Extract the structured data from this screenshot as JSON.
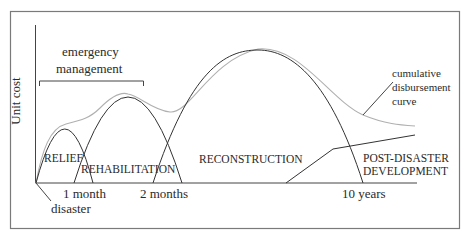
{
  "diagram": {
    "y_axis_label": "Unit cost",
    "bracket_label_line1": "emergency",
    "bracket_label_line2": "management",
    "phases": {
      "relief": "RELIEF",
      "rehabilitation": "REHABILITATION",
      "reconstruction": "RECONSTRUCTION",
      "development_line1": "POST-DISASTER",
      "development_line2": "DEVELOPMENT"
    },
    "x_ticks": {
      "disaster": "disaster",
      "one_month": "1 month",
      "two_months": "2 months",
      "ten_years": "10 years"
    },
    "annotation": {
      "line1": "cumulative",
      "line2": "disbursement",
      "line3": "curve"
    },
    "colors": {
      "frame": "#7a7a7a",
      "curves": "#333333",
      "cumulative_curve": "#b0b0b0",
      "text": "#2a2a2a"
    }
  }
}
